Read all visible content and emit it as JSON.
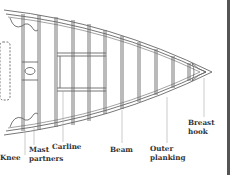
{
  "diagram": {
    "labels": {
      "knee": "Knee",
      "mast_partners_1": "Mast",
      "mast_partners_2": "partners",
      "carline": "Carline",
      "beam": "Beam",
      "outer_planking_1": "Outer",
      "outer_planking_2": "planking",
      "breast_hook_1": "Breast",
      "breast_hook_2": "hook"
    },
    "colors": {
      "line": "#555555",
      "text": "#333333",
      "background": "#ffffff"
    }
  }
}
